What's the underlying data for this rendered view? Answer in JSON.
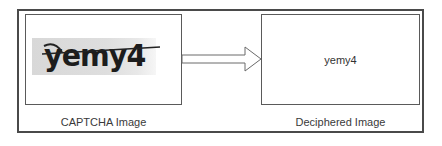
{
  "diagram": {
    "input": {
      "captcha_text": "yemy4",
      "label": "CAPTCHA Image"
    },
    "arrow": {
      "icon": "right-arrow-icon",
      "direction": "right"
    },
    "output": {
      "text": "yemy4",
      "label": "Deciphered Image"
    },
    "colors": {
      "frame": "#4a4a4a",
      "box_border": "#5a5a5a",
      "captcha_bg": "#dcdcdc",
      "captcha_text": "#1c1c1c",
      "label_text": "#3a3a3a"
    }
  }
}
